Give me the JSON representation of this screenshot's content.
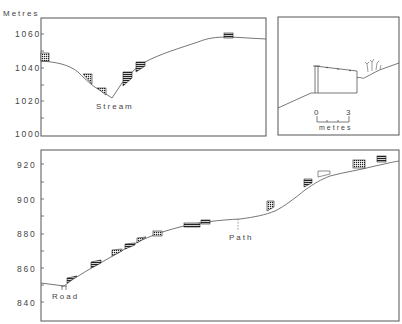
{
  "top_left_panel": {
    "y_axis_title": "Metres",
    "y_ticks": [
      "1060",
      "1040",
      "1020",
      "1000"
    ],
    "annotation": "Stream"
  },
  "top_right_panel": {
    "scale_start": "0",
    "scale_end": "3",
    "scale_unit": "metres"
  },
  "bottom_panel": {
    "y_ticks": [
      "920",
      "900",
      "880",
      "860",
      "840"
    ],
    "annotations": {
      "road": "Road",
      "path": "Path"
    }
  },
  "colors": {
    "frame": "#555555",
    "line": "#666666",
    "house_fill": "#333333"
  }
}
